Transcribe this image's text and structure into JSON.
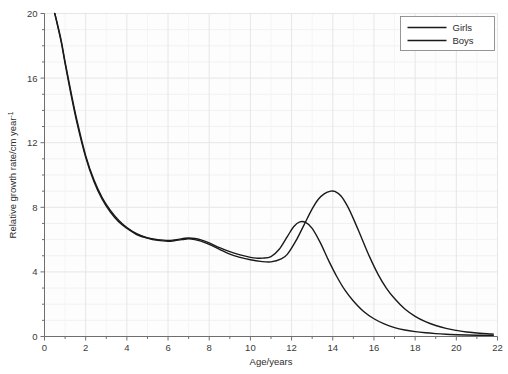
{
  "chart_data": {
    "type": "line",
    "title": "",
    "subtitle": "",
    "xlabel": "Age/years",
    "ylabel": "Relative growth rate/cm year",
    "ylabel_superscript": "-1",
    "xlim": [
      0,
      22
    ],
    "ylim": [
      0,
      20
    ],
    "xticks": [
      0,
      2,
      4,
      6,
      8,
      10,
      12,
      14,
      16,
      18,
      20,
      22
    ],
    "xticklabels": [
      "0",
      "2",
      "4",
      "6",
      "8",
      "10",
      "12",
      "14",
      "16",
      "18",
      "20",
      "22"
    ],
    "xtick_minor_step": 1,
    "yticks": [
      0,
      4,
      8,
      12,
      16,
      20
    ],
    "yticklabels": [
      "0",
      "4",
      "8",
      "12",
      "16",
      "20"
    ],
    "ytick_minor_step": 1,
    "grid": true,
    "grid_color": "#e6e6e6",
    "background_color": "#fdfdfd",
    "legend_position": "top-right",
    "legend_entries": [
      "Girls",
      "Boys"
    ],
    "series": [
      {
        "name": "Girls",
        "color": "#1a1a1a",
        "linewidth": 1.4,
        "x": [
          0.5,
          0.8,
          1.0,
          1.3,
          1.6,
          2.0,
          2.4,
          2.8,
          3.2,
          3.6,
          4.0,
          4.5,
          5.0,
          5.5,
          6.0,
          6.4,
          6.8,
          7.0,
          7.3,
          7.6,
          8.0,
          8.5,
          9.0,
          9.5,
          10.0,
          10.3,
          10.6,
          11.0,
          11.4,
          11.8,
          12.1,
          12.4,
          12.7,
          13.0,
          13.4,
          13.8,
          14.2,
          14.6,
          15.0,
          15.5,
          16.0,
          16.5,
          17.0,
          17.5,
          18.0,
          18.5,
          19.0,
          19.5,
          20.0,
          20.5,
          21.0,
          21.5,
          21.8
        ],
        "y": [
          20.0,
          18.3,
          16.9,
          14.9,
          13.1,
          11.1,
          9.6,
          8.5,
          7.7,
          7.1,
          6.7,
          6.3,
          6.1,
          6.0,
          5.95,
          6.0,
          6.08,
          6.1,
          6.07,
          5.98,
          5.8,
          5.5,
          5.25,
          5.05,
          4.9,
          4.85,
          4.85,
          4.95,
          5.4,
          6.2,
          6.8,
          7.1,
          7.05,
          6.7,
          5.8,
          4.7,
          3.7,
          2.85,
          2.2,
          1.55,
          1.1,
          0.78,
          0.55,
          0.4,
          0.3,
          0.23,
          0.18,
          0.14,
          0.11,
          0.09,
          0.08,
          0.07,
          0.07
        ]
      },
      {
        "name": "Boys",
        "color": "#1a1a1a",
        "linewidth": 1.4,
        "x": [
          0.5,
          0.8,
          1.0,
          1.3,
          1.6,
          2.0,
          2.4,
          2.8,
          3.2,
          3.6,
          4.0,
          4.5,
          5.0,
          5.5,
          6.0,
          6.4,
          6.8,
          7.0,
          7.3,
          7.6,
          8.0,
          8.5,
          9.0,
          9.5,
          10.0,
          10.5,
          11.0,
          11.5,
          11.8,
          12.2,
          12.6,
          13.0,
          13.3,
          13.6,
          13.9,
          14.1,
          14.4,
          14.7,
          15.0,
          15.4,
          15.8,
          16.2,
          16.6,
          17.0,
          17.5,
          18.0,
          18.5,
          19.0,
          19.5,
          20.0,
          20.5,
          21.0,
          21.5,
          21.8
        ],
        "y": [
          20.0,
          18.4,
          17.0,
          15.05,
          13.25,
          11.2,
          9.7,
          8.6,
          7.8,
          7.2,
          6.75,
          6.35,
          6.1,
          5.95,
          5.9,
          5.95,
          6.02,
          6.05,
          6.0,
          5.9,
          5.7,
          5.4,
          5.1,
          4.9,
          4.75,
          4.65,
          4.62,
          4.8,
          5.1,
          5.9,
          6.9,
          7.9,
          8.5,
          8.85,
          9.0,
          8.98,
          8.7,
          8.1,
          7.3,
          6.1,
          4.9,
          3.85,
          3.0,
          2.35,
          1.7,
          1.25,
          0.92,
          0.68,
          0.5,
          0.38,
          0.28,
          0.22,
          0.17,
          0.15
        ]
      }
    ]
  }
}
